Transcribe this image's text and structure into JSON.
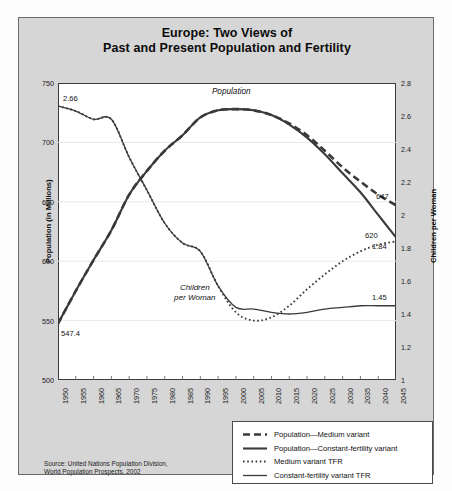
{
  "title": {
    "line1": "Europe: Two Views of",
    "line2": "Past and Present Population and Fertility"
  },
  "axes": {
    "left_label": "Population (in Millions)",
    "right_label": "Children per Woman",
    "left_ticks": [
      "750",
      "700",
      "650",
      "600",
      "550",
      "500"
    ],
    "right_ticks": [
      "2.8",
      "2.6",
      "2.4",
      "2.2",
      "2",
      "1.8",
      "1.6",
      "1.4",
      "1.2",
      "1"
    ],
    "x_ticks": [
      "1950",
      "1955",
      "1960",
      "1965",
      "1970",
      "1975",
      "1980",
      "1985",
      "1990",
      "1995",
      "2000",
      "2005",
      "2010",
      "2015",
      "2020",
      "2025",
      "2030",
      "2035",
      "2040",
      "2045"
    ]
  },
  "annotations": {
    "population_label": "Population",
    "children_label_line1": "Children",
    "children_label_line2": "per Woman",
    "tfr_start": "2.66",
    "pop_start": "547.4",
    "pop_medium_end": "647",
    "pop_constant_end": "620",
    "tfr_medium_end": "1.84",
    "tfr_constant_end": "1.45"
  },
  "legend": {
    "items": [
      {
        "label": "Population—Medium variant",
        "style": "dashed",
        "name": "legend-population-medium"
      },
      {
        "label": "Population—Constant-fertility variant",
        "style": "solid-thick",
        "name": "legend-population-constant"
      },
      {
        "label": "Medium variant TFR",
        "style": "dotted",
        "name": "legend-tfr-medium"
      },
      {
        "label": "Constant-fertility variant TFR",
        "style": "solid-thin",
        "name": "legend-tfr-constant"
      }
    ]
  },
  "source": {
    "line1": "Source: United Nations Population Division,",
    "line2": "World Population Prospects, 2002"
  },
  "colors": {
    "card_background": "#d6d6d6",
    "plot_background": "#ffffff",
    "line": "#3a3a3a",
    "frame": "#3b3b3b",
    "grid": "#e8e8e8"
  },
  "chart_data": {
    "type": "line",
    "title": "Europe: Two Views of Past and Present Population and Fertility",
    "xlabel": "",
    "ylabel": "Population (in Millions)",
    "y2label": "Children per Woman",
    "xlim": [
      1950,
      2045
    ],
    "ylim": [
      500,
      750
    ],
    "y2lim": [
      1,
      2.8
    ],
    "grid": true,
    "legend_position": "bottom-right",
    "x": [
      1950,
      1955,
      1960,
      1965,
      1970,
      1975,
      1980,
      1985,
      1990,
      1995,
      2000,
      2005,
      2010,
      2015,
      2020,
      2025,
      2030,
      2035,
      2040,
      2045
    ],
    "series": [
      {
        "name": "Population—Medium variant",
        "axis": "left",
        "style": "dashed",
        "units": "millions",
        "values": [
          547.4,
          575,
          601,
          626,
          656,
          676,
          693,
          706,
          721,
          727,
          728,
          727,
          723,
          716,
          706,
          693,
          679,
          667,
          656,
          647
        ]
      },
      {
        "name": "Population—Constant-fertility variant",
        "axis": "left",
        "style": "solid-thick",
        "units": "millions",
        "values": [
          547.4,
          575,
          601,
          626,
          656,
          676,
          693,
          706,
          721,
          727,
          728,
          727,
          723,
          715,
          704,
          690,
          674,
          658,
          639,
          620
        ]
      },
      {
        "name": "Medium variant TFR",
        "axis": "right",
        "style": "dotted",
        "units": "children per woman",
        "values": [
          2.66,
          2.63,
          2.58,
          2.58,
          2.35,
          2.15,
          1.95,
          1.83,
          1.78,
          1.57,
          1.41,
          1.36,
          1.38,
          1.45,
          1.55,
          1.64,
          1.72,
          1.78,
          1.82,
          1.84
        ]
      },
      {
        "name": "Constant-fertility variant TFR",
        "axis": "right",
        "style": "solid-thin",
        "units": "children per woman",
        "values": [
          2.66,
          2.63,
          2.58,
          2.58,
          2.35,
          2.15,
          1.95,
          1.83,
          1.78,
          1.57,
          1.44,
          1.43,
          1.41,
          1.4,
          1.41,
          1.43,
          1.44,
          1.45,
          1.45,
          1.45
        ]
      }
    ],
    "annotations": [
      {
        "text": "2.66",
        "x": 1950,
        "value": 2.66,
        "axis": "right"
      },
      {
        "text": "547.4",
        "x": 1950,
        "value": 547.4,
        "axis": "left"
      },
      {
        "text": "647",
        "x": 2045,
        "value": 647,
        "axis": "left"
      },
      {
        "text": "620",
        "x": 2045,
        "value": 620,
        "axis": "left"
      },
      {
        "text": "1.84",
        "x": 2045,
        "value": 1.84,
        "axis": "right"
      },
      {
        "text": "1.45",
        "x": 2045,
        "value": 1.45,
        "axis": "right"
      },
      {
        "text": "Population",
        "x": 2000,
        "value": 740,
        "axis": "left"
      },
      {
        "text": "Children per Woman",
        "x": 1996,
        "value": 1.52,
        "axis": "right"
      }
    ]
  }
}
